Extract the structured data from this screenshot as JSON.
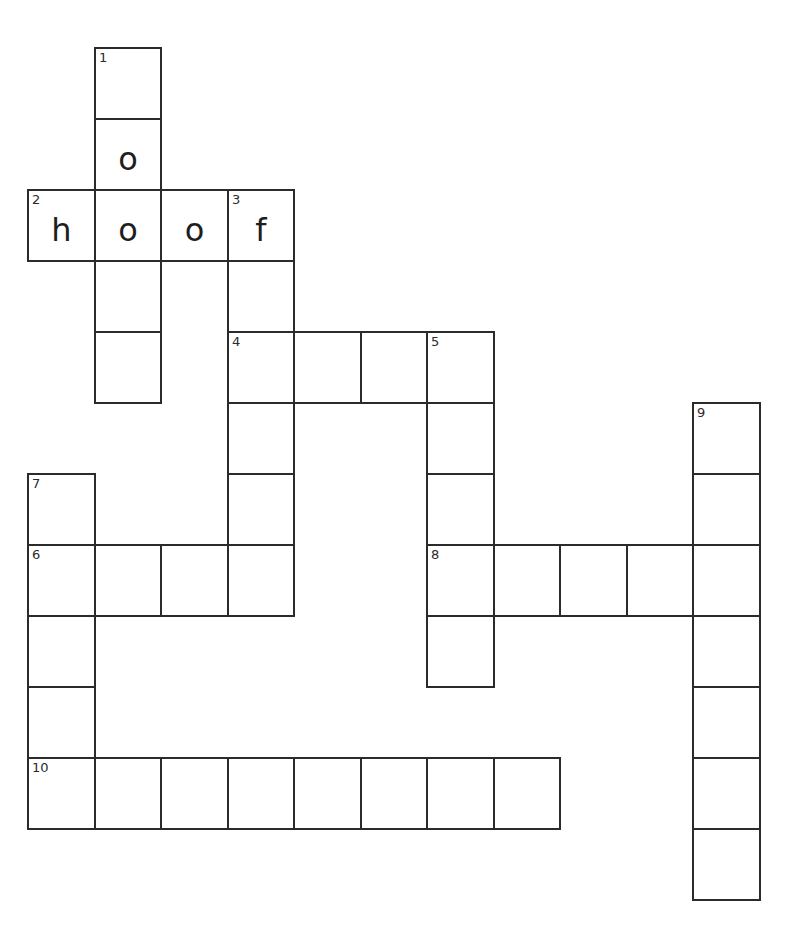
{
  "puzzle": {
    "grid": {
      "origin_x": 28,
      "origin_y": 48,
      "cell_width": 66.5,
      "cell_height": 71,
      "line_color": "#2b2b2b"
    },
    "entries": [
      {
        "number": 1,
        "direction": "down",
        "row": 0,
        "col": 1,
        "length": 5,
        "answer": [
          "",
          "o",
          "",
          "",
          ""
        ]
      },
      {
        "number": 2,
        "direction": "across",
        "row": 2,
        "col": 0,
        "length": 4,
        "answer": [
          "h",
          "o",
          "o",
          "f"
        ]
      },
      {
        "number": 3,
        "direction": "down",
        "row": 2,
        "col": 3,
        "length": 6,
        "answer": [
          "f",
          "",
          "",
          "",
          "",
          ""
        ]
      },
      {
        "number": 4,
        "direction": "across",
        "row": 4,
        "col": 3,
        "length": 4,
        "answer": [
          "",
          "",
          "",
          ""
        ]
      },
      {
        "number": 5,
        "direction": "down",
        "row": 4,
        "col": 6,
        "length": 5,
        "answer": [
          "",
          "",
          "",
          "",
          ""
        ]
      },
      {
        "number": 6,
        "direction": "across",
        "row": 7,
        "col": 0,
        "length": 4,
        "answer": [
          "",
          "",
          "",
          ""
        ]
      },
      {
        "number": 7,
        "direction": "down",
        "row": 6,
        "col": 0,
        "length": 5,
        "answer": [
          "",
          "",
          "",
          "",
          ""
        ]
      },
      {
        "number": 8,
        "direction": "across",
        "row": 7,
        "col": 6,
        "length": 5,
        "answer": [
          "",
          "",
          "",
          "",
          ""
        ]
      },
      {
        "number": 9,
        "direction": "down",
        "row": 5,
        "col": 10,
        "length": 7,
        "answer": [
          "",
          "",
          "",
          "",
          "",
          "",
          ""
        ]
      },
      {
        "number": 10,
        "direction": "across",
        "row": 10,
        "col": 0,
        "length": 8,
        "answer": [
          "",
          "",
          "",
          "",
          "",
          "",
          "",
          ""
        ]
      }
    ]
  }
}
